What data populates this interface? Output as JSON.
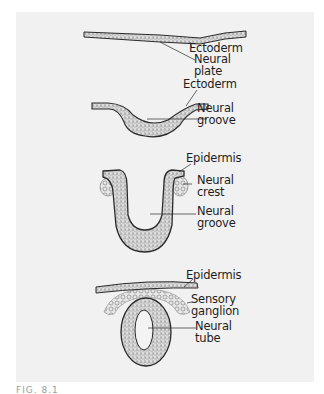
{
  "figure": {
    "stages": [
      {
        "name": "neural-plate-stage",
        "labels": [
          "Ectoderm",
          "Neural",
          "plate"
        ]
      },
      {
        "name": "neural-groove-early-stage",
        "labels": [
          "Ectoderm",
          "Neural",
          "groove"
        ]
      },
      {
        "name": "neural-groove-late-stage",
        "labels": [
          "Epidermis",
          "Neural",
          "crest",
          "Neural",
          "groove"
        ]
      },
      {
        "name": "neural-tube-stage",
        "labels": [
          "Epidermis",
          "Sensory",
          "ganglion",
          "Neural",
          "tube"
        ]
      }
    ],
    "caption": "FIG. 8.1",
    "colors": {
      "panel_background": "#f1f1f1",
      "outline": "#2a2a2a",
      "stipple_fill": "#d4d4d4",
      "text": "#1e1e1e"
    }
  }
}
